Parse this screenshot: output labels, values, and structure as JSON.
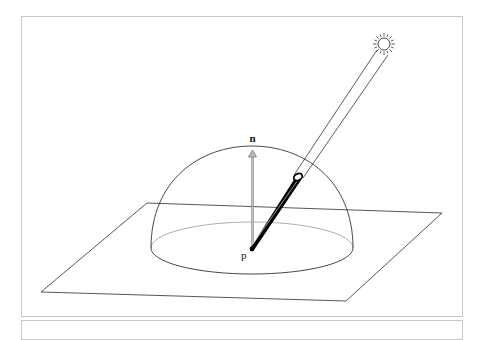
{
  "figure": {
    "labels": {
      "normal": "n",
      "point": "p"
    },
    "elements": {
      "plane": "surface-plane",
      "hemisphere": "hemisphere-of-directions",
      "normal_vector": "surface-normal",
      "light_ray": "incident-light-direction",
      "sun": "light-source"
    },
    "colors": {
      "line": "#333333",
      "normal_arrow": "#888888",
      "ray": "#000000",
      "frame": "#c8c8c8"
    }
  }
}
